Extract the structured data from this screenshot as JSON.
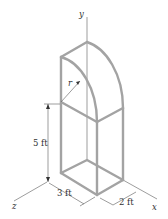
{
  "diagram": {
    "axes": {
      "x_label": "x",
      "y_label": "y",
      "z_label": "z"
    },
    "dimensions": {
      "height_label": "5 ft",
      "width_label": "3 ft",
      "depth_label": "2 ft",
      "radius_label": "r"
    },
    "colors": {
      "frame": "#a3a3a3",
      "lines": "#5a5a5a",
      "text": "#333333",
      "background": "#ffffff"
    }
  }
}
